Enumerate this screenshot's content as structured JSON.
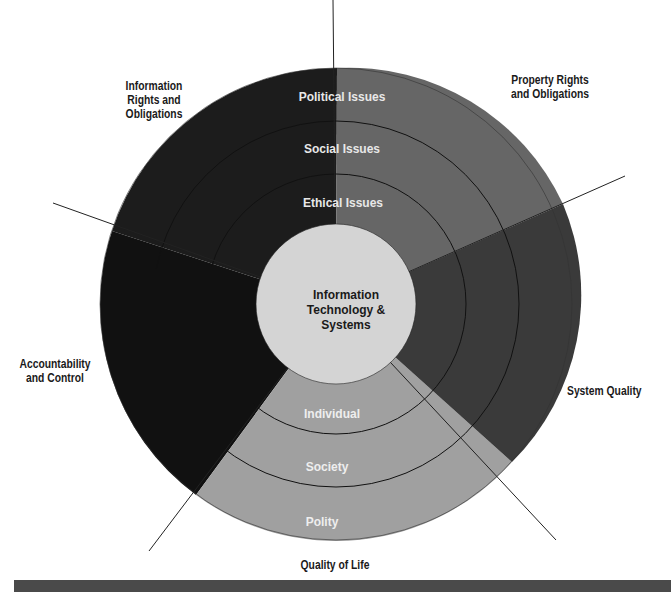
{
  "diagram": {
    "type": "concentric-ring-diagram",
    "center_label": [
      "Information",
      "Technology &",
      "Systems"
    ],
    "rings": {
      "political_social_ethical": [
        "Ethical Issues",
        "Social Issues",
        "Political Issues"
      ],
      "quality_of_life": [
        "Individual",
        "Society",
        "Polity"
      ]
    },
    "ring_labels": {
      "political": "Political Issues",
      "social": "Social Issues",
      "ethical": "Ethical Issues",
      "individual": "Individual",
      "society": "Society",
      "polity": "Polity"
    },
    "sectors": [
      {
        "name": "Property Rights and Obligations",
        "color": "#666666"
      },
      {
        "name": "System Quality",
        "color": "#3a3a3a"
      },
      {
        "name": "Quality of Life",
        "color": "#a0a0a0"
      },
      {
        "name": "Accountability and Control",
        "color": "#111111"
      },
      {
        "name": "Information Rights and Obligations",
        "color": "#1c1c1c"
      }
    ],
    "outer_labels": {
      "information_rights": [
        "Information",
        "Rights and",
        "Obligations"
      ],
      "property_rights": [
        "Property Rights",
        "and Obligations"
      ],
      "accountability": [
        "Accountability",
        "and Control"
      ],
      "system_quality": "System Quality",
      "quality_of_life": "Quality of Life"
    },
    "colors": {
      "center_fill": "#d4d4d4",
      "ring_line": "#111111",
      "label_light": "#e8e8e8",
      "label_dark": "#1a1a1a",
      "bottom_bar": "#4a4a4a"
    }
  }
}
